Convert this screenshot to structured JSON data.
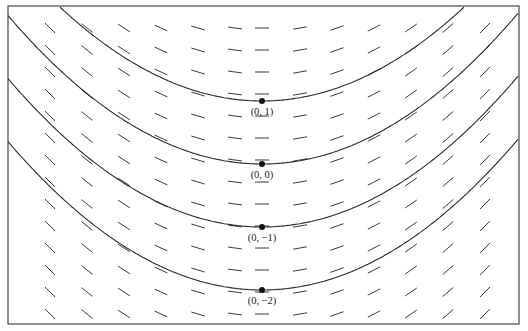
{
  "figure": {
    "frame": {
      "x": 8,
      "y": 6,
      "width": 511,
      "height": 318
    },
    "colors": {
      "ink": "#2a2a2a",
      "segment": "#3a3a3a",
      "background": "#ffffff"
    },
    "coordinate_map": {
      "x_center_px": 262,
      "unit_px_x": 150,
      "y0_px": 164,
      "unit_px_y": 63
    },
    "points": [
      {
        "label": "(0, 1)",
        "x": 0,
        "y": 1,
        "px": 262,
        "py": 101
      },
      {
        "label": "(0, 0)",
        "x": 0,
        "y": 0,
        "px": 262,
        "py": 164
      },
      {
        "label": "(0, −1)",
        "x": 0,
        "y": -1,
        "px": 262,
        "py": 227
      },
      {
        "label": "(0, −2)",
        "x": 0,
        "y": -2,
        "px": 262,
        "py": 290
      }
    ],
    "slope_field": {
      "columns_px": [
        50,
        87,
        124,
        161,
        198,
        235,
        262,
        300,
        337,
        374,
        411,
        448,
        485
      ],
      "rows_px": [
        28,
        50,
        72,
        94,
        116,
        138,
        160,
        182,
        204,
        226,
        248,
        270,
        292,
        314
      ],
      "segment_half_length_px": 7
    },
    "curves": [
      {
        "name": "solution-through-(0,1)",
        "passes_through": "(0, 1)"
      },
      {
        "name": "solution-through-(0,0)",
        "passes_through": "(0, 0)"
      },
      {
        "name": "solution-through-(0,-1)",
        "passes_through": "(0, −1)"
      },
      {
        "name": "solution-through-(0,-2)",
        "passes_through": "(0, −2)"
      }
    ]
  }
}
